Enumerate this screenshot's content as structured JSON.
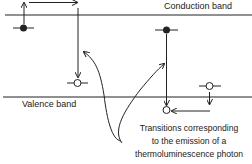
{
  "diagram": {
    "labels": {
      "conduction_band": "Conduction band",
      "valence_band": "Valence band"
    },
    "caption": {
      "lines": [
        "Transitions corresponding",
        "to the emission of a",
        "thermoluminescence photon"
      ]
    },
    "colors": {
      "line": "#222222",
      "background": "#ffffff"
    },
    "elements": [
      {
        "type": "band-line",
        "name": "conduction-band",
        "y": 15
      },
      {
        "type": "band-line",
        "name": "valence-band",
        "y": 97
      },
      {
        "type": "electron-trap",
        "filled": true,
        "x": 23,
        "y": 27
      },
      {
        "type": "hole-recombination-center",
        "filled": false,
        "x": 77,
        "y": 82
      },
      {
        "type": "electron-trap",
        "filled": true,
        "x": 166,
        "y": 30
      },
      {
        "type": "recombination-center",
        "filled": false,
        "x": 166,
        "y": 110
      },
      {
        "type": "hole-trap",
        "filled": false,
        "x": 209,
        "y": 86
      }
    ]
  }
}
